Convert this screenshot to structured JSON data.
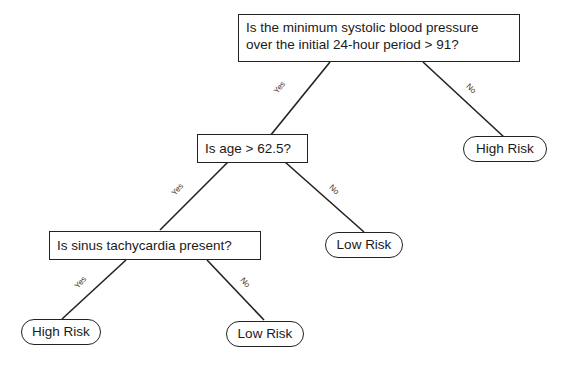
{
  "diagram": {
    "type": "decision-tree",
    "nodes": {
      "root": {
        "kind": "decision",
        "line1": "Is the minimum systolic blood pressure",
        "line2": "over the initial 24-hour period > 91?"
      },
      "age": {
        "kind": "decision",
        "label": "Is age > 62.5?"
      },
      "sinus": {
        "kind": "decision",
        "label": "Is sinus tachycardia present?"
      },
      "leaf_root_no": {
        "kind": "leaf",
        "label": "High Risk"
      },
      "leaf_age_no": {
        "kind": "leaf",
        "label": "Low Risk"
      },
      "leaf_sinus_yes": {
        "kind": "leaf",
        "label": "High Risk"
      },
      "leaf_sinus_no": {
        "kind": "leaf",
        "label": "Low Risk"
      }
    },
    "edges": {
      "root_yes": {
        "from": "root",
        "to": "age",
        "label": "Yes"
      },
      "root_no": {
        "from": "root",
        "to": "leaf_root_no",
        "label": "No"
      },
      "age_yes": {
        "from": "age",
        "to": "sinus",
        "label": "Yes"
      },
      "age_no": {
        "from": "age",
        "to": "leaf_age_no",
        "label": "No"
      },
      "sinus_yes": {
        "from": "sinus",
        "to": "leaf_sinus_yes",
        "label": "Yes"
      },
      "sinus_no": {
        "from": "sinus",
        "to": "leaf_sinus_no",
        "label": "No"
      }
    }
  }
}
